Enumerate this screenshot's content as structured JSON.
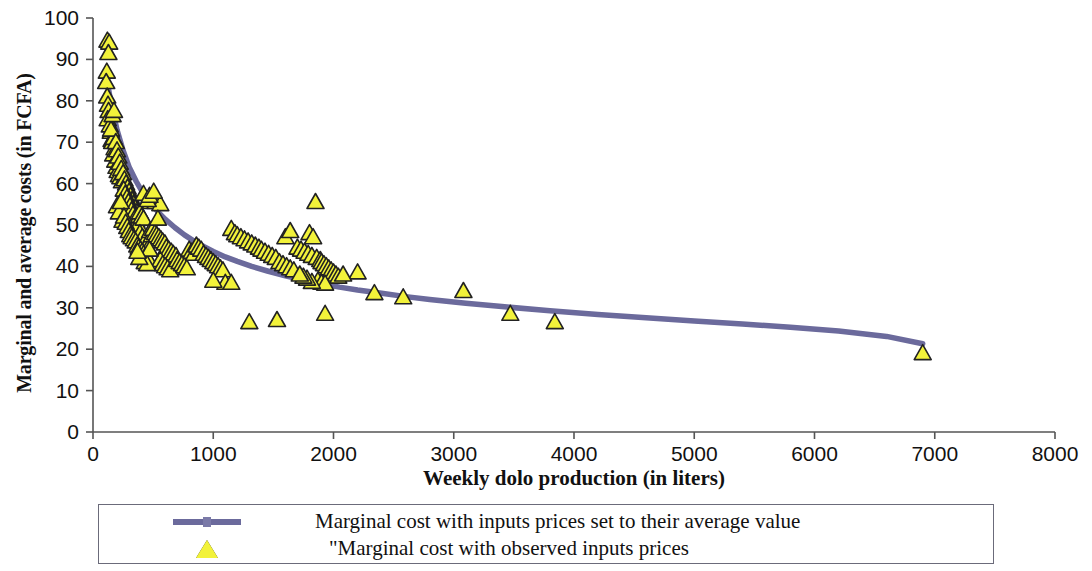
{
  "chart_data": {
    "type": "scatter",
    "title": "",
    "xlabel": "Weekly dolo production (in liters)",
    "ylabel": "Marginal and average costs (in FCFA)",
    "xlim": [
      0,
      8000
    ],
    "ylim": [
      0,
      100
    ],
    "xticks": [
      "0",
      "1000",
      "2000",
      "3000",
      "4000",
      "5000",
      "6000",
      "7000",
      "8000"
    ],
    "yticks": [
      "0",
      "10",
      "20",
      "30",
      "40",
      "50",
      "60",
      "70",
      "80",
      "90",
      "100"
    ],
    "grid": false,
    "legend_position": "bottom-outside",
    "colors": {
      "line": "#6b6a9c",
      "marker_fill": "#f2f23a",
      "marker_edge": "#222222",
      "axis": "#555555",
      "text": "#111111"
    },
    "series": [
      {
        "name": "Marginal cost with inputs prices set to their average value",
        "type": "line",
        "marker": "none",
        "color": "#6b6a9c",
        "points": [
          [
            110,
            86.0
          ],
          [
            150,
            79.5
          ],
          [
            200,
            73.0
          ],
          [
            250,
            68.0
          ],
          [
            300,
            64.0
          ],
          [
            360,
            60.5
          ],
          [
            420,
            57.5
          ],
          [
            480,
            55.2
          ],
          [
            540,
            53.2
          ],
          [
            600,
            51.4
          ],
          [
            680,
            49.4
          ],
          [
            760,
            47.6
          ],
          [
            840,
            46.1
          ],
          [
            920,
            44.8
          ],
          [
            1000,
            43.6
          ],
          [
            1100,
            42.3
          ],
          [
            1200,
            41.2
          ],
          [
            1320,
            40.0
          ],
          [
            1450,
            38.9
          ],
          [
            1600,
            37.7
          ],
          [
            1750,
            36.7
          ],
          [
            1900,
            35.8
          ],
          [
            2050,
            35.0
          ],
          [
            2200,
            34.3
          ],
          [
            2400,
            33.5
          ],
          [
            2600,
            32.7
          ],
          [
            2800,
            32.0
          ],
          [
            3100,
            31.1
          ],
          [
            3400,
            30.3
          ],
          [
            3800,
            29.3
          ],
          [
            4200,
            28.4
          ],
          [
            4600,
            27.6
          ],
          [
            5000,
            26.8
          ],
          [
            5400,
            26.1
          ],
          [
            5800,
            25.3
          ],
          [
            6200,
            24.4
          ],
          [
            6600,
            23.1
          ],
          [
            6900,
            21.3
          ]
        ]
      },
      {
        "name": "\"Marginal cost with observed inputs prices",
        "type": "scatter",
        "marker": "triangle",
        "color": "#f2f23a",
        "points": [
          [
            120,
            94.5
          ],
          [
            135,
            94.0
          ],
          [
            128,
            91.5
          ],
          [
            115,
            87.0
          ],
          [
            110,
            84.5
          ],
          [
            118,
            81.0
          ],
          [
            125,
            79.0
          ],
          [
            130,
            77.5
          ],
          [
            122,
            75.5
          ],
          [
            140,
            74.0
          ],
          [
            148,
            72.5
          ],
          [
            155,
            70.5
          ],
          [
            160,
            70.0
          ],
          [
            172,
            71.0
          ],
          [
            180,
            68.5
          ],
          [
            168,
            67.0
          ],
          [
            185,
            65.5
          ],
          [
            195,
            64.0
          ],
          [
            205,
            63.0
          ],
          [
            215,
            62.0
          ],
          [
            228,
            61.5
          ],
          [
            240,
            60.5
          ],
          [
            150,
            73.0
          ],
          [
            163,
            76.5
          ],
          [
            175,
            77.5
          ],
          [
            190,
            70.0
          ],
          [
            200,
            68.0
          ],
          [
            210,
            66.5
          ],
          [
            222,
            65.0
          ],
          [
            235,
            63.5
          ],
          [
            250,
            62.5
          ],
          [
            262,
            61.0
          ],
          [
            275,
            60.0
          ],
          [
            288,
            59.0
          ],
          [
            300,
            58.0
          ],
          [
            312,
            57.0
          ],
          [
            325,
            56.0
          ],
          [
            338,
            55.0
          ],
          [
            350,
            54.0
          ],
          [
            365,
            53.0
          ],
          [
            255,
            58.5
          ],
          [
            268,
            57.5
          ],
          [
            282,
            56.5
          ],
          [
            295,
            55.5
          ],
          [
            308,
            54.5
          ],
          [
            320,
            53.5
          ],
          [
            333,
            52.5
          ],
          [
            346,
            51.5
          ],
          [
            360,
            51.0
          ],
          [
            375,
            50.0
          ],
          [
            200,
            54.5
          ],
          [
            215,
            53.0
          ],
          [
            230,
            55.5
          ],
          [
            245,
            51.0
          ],
          [
            258,
            52.0
          ],
          [
            272,
            50.5
          ],
          [
            285,
            49.5
          ],
          [
            298,
            48.5
          ],
          [
            310,
            47.5
          ],
          [
            322,
            47.0
          ],
          [
            390,
            53.0
          ],
          [
            405,
            52.0
          ],
          [
            420,
            51.5
          ],
          [
            390,
            48.0
          ],
          [
            410,
            47.0
          ],
          [
            430,
            46.0
          ],
          [
            445,
            45.0
          ],
          [
            460,
            44.5
          ],
          [
            475,
            48.5
          ],
          [
            490,
            47.5
          ],
          [
            340,
            46.5
          ],
          [
            355,
            46.0
          ],
          [
            368,
            45.0
          ],
          [
            380,
            44.5
          ],
          [
            395,
            44.0
          ],
          [
            408,
            43.5
          ],
          [
            422,
            43.0
          ],
          [
            436,
            42.5
          ],
          [
            450,
            42.0
          ],
          [
            465,
            41.5
          ],
          [
            480,
            55.5
          ],
          [
            520,
            55.5
          ],
          [
            560,
            55.0
          ],
          [
            500,
            49.0
          ],
          [
            515,
            48.0
          ],
          [
            530,
            47.5
          ],
          [
            548,
            47.0
          ],
          [
            565,
            46.5
          ],
          [
            580,
            46.0
          ],
          [
            598,
            45.5
          ],
          [
            610,
            44.5
          ],
          [
            630,
            44.0
          ],
          [
            650,
            43.5
          ],
          [
            668,
            43.0
          ],
          [
            690,
            42.5
          ],
          [
            560,
            41.5
          ],
          [
            580,
            40.5
          ],
          [
            600,
            40.0
          ],
          [
            620,
            39.5
          ],
          [
            642,
            39.0
          ],
          [
            430,
            41.0
          ],
          [
            450,
            40.5
          ],
          [
            470,
            44.0
          ],
          [
            385,
            42.0
          ],
          [
            370,
            43.5
          ],
          [
            420,
            57.5
          ],
          [
            455,
            56.0
          ],
          [
            470,
            57.0
          ],
          [
            505,
            58.0
          ],
          [
            540,
            51.5
          ],
          [
            700,
            41.5
          ],
          [
            720,
            41.0
          ],
          [
            740,
            40.5
          ],
          [
            760,
            40.0
          ],
          [
            780,
            39.5
          ],
          [
            800,
            44.0
          ],
          [
            820,
            43.5
          ],
          [
            840,
            43.0
          ],
          [
            860,
            45.0
          ],
          [
            880,
            44.5
          ],
          [
            900,
            44.0
          ],
          [
            920,
            43.0
          ],
          [
            940,
            42.5
          ],
          [
            960,
            42.0
          ],
          [
            980,
            41.5
          ],
          [
            1000,
            41.0
          ],
          [
            1020,
            40.5
          ],
          [
            1040,
            40.0
          ],
          [
            1060,
            39.5
          ],
          [
            1080,
            39.0
          ],
          [
            1100,
            36.0
          ],
          [
            1150,
            49.0
          ],
          [
            1180,
            48.0
          ],
          [
            1200,
            47.5
          ],
          [
            1230,
            47.0
          ],
          [
            1260,
            46.5
          ],
          [
            1290,
            46.0
          ],
          [
            1320,
            45.5
          ],
          [
            1350,
            45.0
          ],
          [
            1380,
            44.5
          ],
          [
            1400,
            44.0
          ],
          [
            1430,
            43.5
          ],
          [
            1460,
            43.0
          ],
          [
            1490,
            42.5
          ],
          [
            1520,
            42.0
          ],
          [
            1550,
            41.0
          ],
          [
            1580,
            40.5
          ],
          [
            1610,
            40.0
          ],
          [
            1640,
            39.5
          ],
          [
            1670,
            39.0
          ],
          [
            1700,
            44.5
          ],
          [
            1730,
            44.0
          ],
          [
            1760,
            43.5
          ],
          [
            1790,
            43.0
          ],
          [
            1820,
            42.5
          ],
          [
            1850,
            55.5
          ],
          [
            1800,
            48.0
          ],
          [
            1830,
            47.0
          ],
          [
            1860,
            42.0
          ],
          [
            1890,
            41.5
          ],
          [
            1900,
            41.0
          ],
          [
            1920,
            40.5
          ],
          [
            1940,
            40.0
          ],
          [
            1960,
            39.5
          ],
          [
            1980,
            39.0
          ],
          [
            2000,
            38.5
          ],
          [
            2020,
            38.0
          ],
          [
            2040,
            37.5
          ],
          [
            1870,
            36.5
          ],
          [
            1900,
            36.0
          ],
          [
            1930,
            35.8
          ],
          [
            1820,
            36.2
          ],
          [
            1780,
            37.0
          ],
          [
            1750,
            37.5
          ],
          [
            1720,
            38.0
          ],
          [
            1300,
            26.5
          ],
          [
            1530,
            27.0
          ],
          [
            1930,
            28.5
          ],
          [
            1150,
            36.0
          ],
          [
            1000,
            36.5
          ],
          [
            2340,
            33.5
          ],
          [
            2580,
            32.5
          ],
          [
            3080,
            34.0
          ],
          [
            3470,
            28.5
          ],
          [
            3840,
            26.5
          ],
          [
            6900,
            19.0
          ],
          [
            2200,
            38.5
          ],
          [
            2080,
            38.0
          ],
          [
            1600,
            47.0
          ],
          [
            1640,
            48.5
          ]
        ]
      }
    ]
  },
  "axis": {
    "xticks": [
      "0",
      "1000",
      "2000",
      "3000",
      "4000",
      "5000",
      "6000",
      "7000",
      "8000"
    ],
    "yticks": [
      "100",
      "90",
      "80",
      "70",
      "60",
      "50",
      "40",
      "30",
      "20",
      "10",
      "0"
    ],
    "xlabel": "Weekly dolo production (in liters)",
    "ylabel": "Marginal and average costs (in FCFA)"
  },
  "legend": {
    "items": [
      {
        "key": "line-swatch",
        "label": "Marginal cost with inputs prices set to their average value"
      },
      {
        "key": "triangle-marker",
        "label": "\"Marginal cost with observed inputs prices"
      }
    ]
  }
}
